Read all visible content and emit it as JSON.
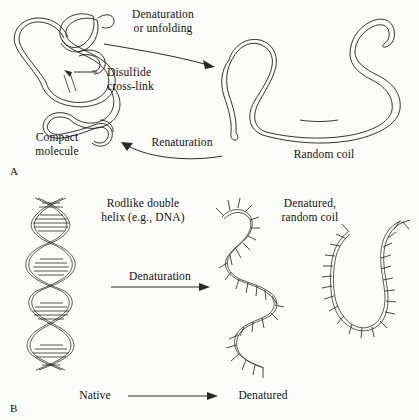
{
  "figure": {
    "background_color": "#fcfcfa",
    "ink_color": "#1d1d1d"
  },
  "panel_a": {
    "letter": "A",
    "labels": {
      "denaturation": "Denaturation\nor unfolding",
      "disulfide": "Disulfide\ncross-link",
      "compact": "Compact\nmolecule",
      "renaturation": "Renaturation",
      "random_coil": "Random coil"
    },
    "arrows": [
      {
        "name": "denaturation-arrow",
        "direction": "left-to-right",
        "label": "Denaturation or unfolding"
      },
      {
        "name": "renaturation-arrow",
        "direction": "right-to-left",
        "label": "Renaturation"
      }
    ],
    "structures": [
      {
        "name": "compact-molecule",
        "description": "folded compact polypeptide with disulfide cross-link"
      },
      {
        "name": "random-coil",
        "description": "extended unfolded random coil chain"
      }
    ]
  },
  "panel_b": {
    "letter": "B",
    "labels": {
      "rodlike": "Rodlike double\nhelix (e.g., DNA)",
      "denatured_coil": "Denatured,\nrandom coil",
      "denaturation": "Denaturation",
      "native": "Native",
      "denatured": "Denatured"
    },
    "arrows": [
      {
        "name": "denaturation-arrow",
        "direction": "left-to-right",
        "label": "Denaturation"
      },
      {
        "name": "native-denatured-arrow",
        "direction": "left-to-right",
        "label": ""
      }
    ],
    "structures": [
      {
        "name": "dna-double-helix",
        "description": "rodlike double helix with base-pair rungs"
      },
      {
        "name": "denatured-strand-left",
        "description": "wavy single strand with unpaired base ticks"
      },
      {
        "name": "denatured-strand-right",
        "description": "hairpin single strand with unpaired base ticks"
      }
    ]
  }
}
